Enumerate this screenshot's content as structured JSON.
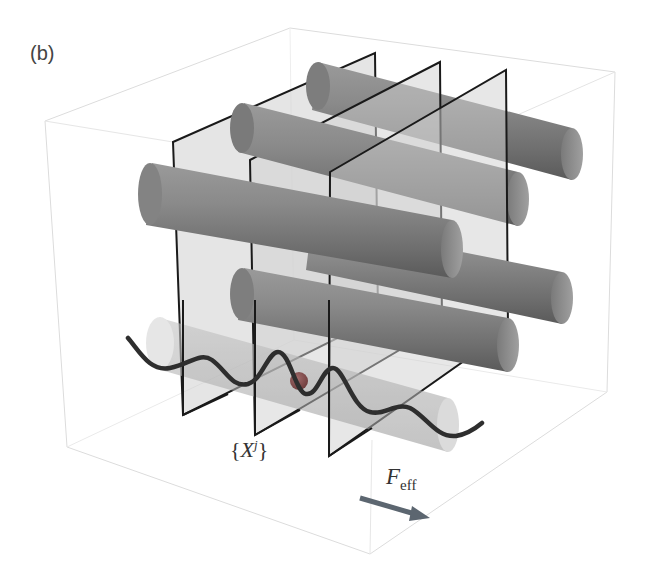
{
  "figure": {
    "panel_label": "(b)",
    "labels": {
      "slices": {
        "open_brace": "{",
        "symbol": "X",
        "superscript": "j",
        "close_brace": "}"
      },
      "force": {
        "symbol": "F",
        "subscript": "eff"
      }
    },
    "colors": {
      "background": "#ffffff",
      "box_edge": "#d8d8d8",
      "plane_fill": "#c8c8c8",
      "plane_edge": "#1a1a1a",
      "cylinder_dark": "#6a6a6a",
      "cylinder_mid": "#8e8e8e",
      "cylinder_light": "#a9a9a9",
      "ghost_cylinder": "#bdbdbd",
      "wave": "#2e2e2e",
      "particle": "#8a4a4a",
      "arrow": "#5c6670"
    },
    "elements": {
      "bounding_box": "transparent cube outline",
      "planes": 3,
      "cylinders": 5,
      "ghost_cylinder": 1,
      "potential_wave": "sinusoidal potential along bottom cylinder",
      "particle": "single sphere in potential well",
      "force_arrow": "arrow indicating effective force direction"
    }
  }
}
